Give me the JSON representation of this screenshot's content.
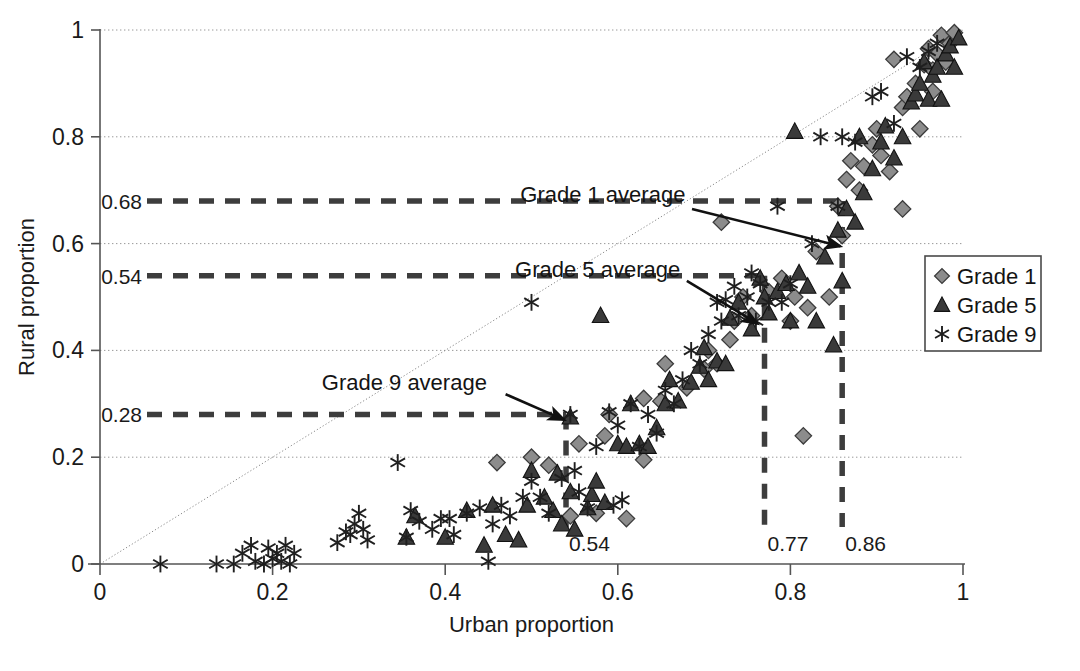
{
  "chart_data": {
    "type": "scatter",
    "title": "",
    "xlabel": "Urban proportion",
    "ylabel": "Rural proportion",
    "xlim": [
      0,
      1
    ],
    "ylim": [
      0,
      1
    ],
    "xticks": [
      "0",
      "0.2",
      "0.4",
      "0.6",
      "0.8",
      "1"
    ],
    "xtick_values": [
      0,
      0.2,
      0.4,
      0.6,
      0.8,
      1
    ],
    "yticks": [
      "0",
      "0.2",
      "0.4",
      "0.6",
      "0.8",
      "1"
    ],
    "ytick_values": [
      0,
      0.2,
      0.4,
      0.6,
      0.8,
      1
    ],
    "grid": true,
    "grid_style": "dotted horizontal gridlines at y = 0.2, 0.4, 0.6, 0.8, 1",
    "legend_position": "right-middle",
    "reference_line": {
      "name": "y = x identity line",
      "style": "dotted",
      "from": [
        0,
        0
      ],
      "to": [
        1,
        1
      ]
    },
    "series": [
      {
        "name": "Grade 1",
        "marker": "diamond",
        "color": "#8c8c8c",
        "edge_color": "#333333",
        "points": [
          [
            0.46,
            0.19
          ],
          [
            0.5,
            0.2
          ],
          [
            0.52,
            0.185
          ],
          [
            0.545,
            0.09
          ],
          [
            0.575,
            0.095
          ],
          [
            0.61,
            0.085
          ],
          [
            0.585,
            0.24
          ],
          [
            0.63,
            0.195
          ],
          [
            0.555,
            0.225
          ],
          [
            0.59,
            0.28
          ],
          [
            0.63,
            0.31
          ],
          [
            0.65,
            0.305
          ],
          [
            0.655,
            0.375
          ],
          [
            0.68,
            0.33
          ],
          [
            0.7,
            0.365
          ],
          [
            0.705,
            0.4
          ],
          [
            0.715,
            0.375
          ],
          [
            0.73,
            0.42
          ],
          [
            0.735,
            0.455
          ],
          [
            0.745,
            0.5
          ],
          [
            0.755,
            0.465
          ],
          [
            0.775,
            0.51
          ],
          [
            0.79,
            0.535
          ],
          [
            0.815,
            0.24
          ],
          [
            0.8,
            0.455
          ],
          [
            0.805,
            0.5
          ],
          [
            0.82,
            0.48
          ],
          [
            0.83,
            0.585
          ],
          [
            0.845,
            0.5
          ],
          [
            0.855,
            0.67
          ],
          [
            0.86,
            0.615
          ],
          [
            0.865,
            0.72
          ],
          [
            0.87,
            0.755
          ],
          [
            0.88,
            0.7
          ],
          [
            0.885,
            0.745
          ],
          [
            0.895,
            0.785
          ],
          [
            0.9,
            0.815
          ],
          [
            0.905,
            0.765
          ],
          [
            0.915,
            0.735
          ],
          [
            0.92,
            0.945
          ],
          [
            0.93,
            0.855
          ],
          [
            0.935,
            0.875
          ],
          [
            0.945,
            0.9
          ],
          [
            0.95,
            0.815
          ],
          [
            0.955,
            0.935
          ],
          [
            0.96,
            0.965
          ],
          [
            0.965,
            0.925
          ],
          [
            0.97,
            0.955
          ],
          [
            0.975,
            0.99
          ],
          [
            0.98,
            0.94
          ],
          [
            0.985,
            0.975
          ],
          [
            0.99,
            0.995
          ],
          [
            0.93,
            0.665
          ],
          [
            0.965,
            0.885
          ],
          [
            0.72,
            0.64
          ]
        ]
      },
      {
        "name": "Grade 5",
        "marker": "triangle",
        "color": "#3a3a3a",
        "edge_color": "#1a1a1a",
        "points": [
          [
            0.355,
            0.05
          ],
          [
            0.365,
            0.09
          ],
          [
            0.4,
            0.05
          ],
          [
            0.425,
            0.1
          ],
          [
            0.445,
            0.035
          ],
          [
            0.455,
            0.11
          ],
          [
            0.47,
            0.055
          ],
          [
            0.485,
            0.045
          ],
          [
            0.495,
            0.11
          ],
          [
            0.5,
            0.175
          ],
          [
            0.515,
            0.125
          ],
          [
            0.525,
            0.1
          ],
          [
            0.53,
            0.17
          ],
          [
            0.535,
            0.075
          ],
          [
            0.545,
            0.135
          ],
          [
            0.55,
            0.065
          ],
          [
            0.565,
            0.105
          ],
          [
            0.57,
            0.13
          ],
          [
            0.575,
            0.155
          ],
          [
            0.585,
            0.115
          ],
          [
            0.6,
            0.225
          ],
          [
            0.61,
            0.22
          ],
          [
            0.625,
            0.225
          ],
          [
            0.635,
            0.22
          ],
          [
            0.645,
            0.255
          ],
          [
            0.655,
            0.3
          ],
          [
            0.66,
            0.345
          ],
          [
            0.67,
            0.305
          ],
          [
            0.685,
            0.34
          ],
          [
            0.695,
            0.37
          ],
          [
            0.7,
            0.405
          ],
          [
            0.705,
            0.345
          ],
          [
            0.715,
            0.38
          ],
          [
            0.725,
            0.375
          ],
          [
            0.73,
            0.46
          ],
          [
            0.74,
            0.49
          ],
          [
            0.755,
            0.44
          ],
          [
            0.765,
            0.535
          ],
          [
            0.77,
            0.5
          ],
          [
            0.775,
            0.47
          ],
          [
            0.785,
            0.51
          ],
          [
            0.795,
            0.525
          ],
          [
            0.8,
            0.455
          ],
          [
            0.805,
            0.81
          ],
          [
            0.81,
            0.545
          ],
          [
            0.82,
            0.52
          ],
          [
            0.83,
            0.455
          ],
          [
            0.84,
            0.575
          ],
          [
            0.85,
            0.41
          ],
          [
            0.855,
            0.625
          ],
          [
            0.86,
            0.53
          ],
          [
            0.865,
            0.665
          ],
          [
            0.875,
            0.64
          ],
          [
            0.88,
            0.8
          ],
          [
            0.885,
            0.695
          ],
          [
            0.895,
            0.74
          ],
          [
            0.905,
            0.79
          ],
          [
            0.91,
            0.82
          ],
          [
            0.92,
            0.76
          ],
          [
            0.93,
            0.8
          ],
          [
            0.94,
            0.865
          ],
          [
            0.945,
            0.88
          ],
          [
            0.95,
            0.9
          ],
          [
            0.955,
            0.94
          ],
          [
            0.96,
            0.87
          ],
          [
            0.965,
            0.915
          ],
          [
            0.97,
            0.93
          ],
          [
            0.975,
            0.87
          ],
          [
            0.98,
            0.955
          ],
          [
            0.985,
            0.97
          ],
          [
            0.99,
            0.93
          ],
          [
            0.995,
            0.985
          ],
          [
            0.58,
            0.465
          ],
          [
            0.545,
            0.275
          ],
          [
            0.615,
            0.3
          ]
        ]
      },
      {
        "name": "Grade 9",
        "marker": "asterisk",
        "color": "#222222",
        "edge_color": "#111111",
        "points": [
          [
            0.07,
            0.0
          ],
          [
            0.135,
            0.0
          ],
          [
            0.155,
            0.0
          ],
          [
            0.165,
            0.02
          ],
          [
            0.175,
            0.035
          ],
          [
            0.18,
            0.005
          ],
          [
            0.19,
            0.0
          ],
          [
            0.195,
            0.03
          ],
          [
            0.2,
            0.01
          ],
          [
            0.205,
            0.02
          ],
          [
            0.21,
            0.005
          ],
          [
            0.215,
            0.035
          ],
          [
            0.22,
            0.0
          ],
          [
            0.225,
            0.02
          ],
          [
            0.275,
            0.04
          ],
          [
            0.285,
            0.06
          ],
          [
            0.29,
            0.055
          ],
          [
            0.295,
            0.075
          ],
          [
            0.3,
            0.095
          ],
          [
            0.305,
            0.065
          ],
          [
            0.31,
            0.045
          ],
          [
            0.345,
            0.19
          ],
          [
            0.355,
            0.05
          ],
          [
            0.36,
            0.1
          ],
          [
            0.37,
            0.08
          ],
          [
            0.385,
            0.065
          ],
          [
            0.395,
            0.085
          ],
          [
            0.405,
            0.085
          ],
          [
            0.41,
            0.055
          ],
          [
            0.425,
            0.095
          ],
          [
            0.44,
            0.105
          ],
          [
            0.45,
            0.005
          ],
          [
            0.455,
            0.075
          ],
          [
            0.465,
            0.11
          ],
          [
            0.475,
            0.09
          ],
          [
            0.49,
            0.125
          ],
          [
            0.5,
            0.155
          ],
          [
            0.51,
            0.125
          ],
          [
            0.52,
            0.095
          ],
          [
            0.535,
            0.16
          ],
          [
            0.545,
            0.28
          ],
          [
            0.55,
            0.175
          ],
          [
            0.555,
            0.135
          ],
          [
            0.5,
            0.49
          ],
          [
            0.575,
            0.22
          ],
          [
            0.59,
            0.285
          ],
          [
            0.6,
            0.26
          ],
          [
            0.615,
            0.3
          ],
          [
            0.625,
            0.22
          ],
          [
            0.635,
            0.28
          ],
          [
            0.645,
            0.245
          ],
          [
            0.655,
            0.325
          ],
          [
            0.665,
            0.3
          ],
          [
            0.675,
            0.345
          ],
          [
            0.685,
            0.4
          ],
          [
            0.695,
            0.375
          ],
          [
            0.705,
            0.43
          ],
          [
            0.715,
            0.49
          ],
          [
            0.72,
            0.455
          ],
          [
            0.725,
            0.495
          ],
          [
            0.735,
            0.52
          ],
          [
            0.74,
            0.465
          ],
          [
            0.75,
            0.5
          ],
          [
            0.755,
            0.545
          ],
          [
            0.76,
            0.455
          ],
          [
            0.765,
            0.525
          ],
          [
            0.775,
            0.49
          ],
          [
            0.785,
            0.67
          ],
          [
            0.79,
            0.49
          ],
          [
            0.8,
            0.525
          ],
          [
            0.825,
            0.6
          ],
          [
            0.835,
            0.8
          ],
          [
            0.855,
            0.67
          ],
          [
            0.86,
            0.8
          ],
          [
            0.875,
            0.79
          ],
          [
            0.895,
            0.875
          ],
          [
            0.905,
            0.885
          ],
          [
            0.92,
            0.825
          ],
          [
            0.935,
            0.95
          ],
          [
            0.95,
            0.93
          ],
          [
            0.96,
            0.96
          ],
          [
            0.97,
            0.975
          ],
          [
            0.605,
            0.12
          ],
          [
            0.595,
            0.11
          ],
          [
            0.565,
            0.105
          ]
        ]
      }
    ],
    "annotations": [
      {
        "id": "grade1-avg",
        "label": "Grade 1 average",
        "text_x": 0.487,
        "text_y": 0.692,
        "arrow_from": [
          0.686,
          0.665
        ],
        "arrow_to": [
          0.858,
          0.595
        ],
        "value_x": 0.86,
        "value_y": 0.68
      },
      {
        "id": "grade5-avg",
        "label": "Grade 5 average",
        "text_x": 0.481,
        "text_y": 0.553,
        "arrow_from": [
          0.68,
          0.53
        ],
        "arrow_to": [
          0.762,
          0.45
        ],
        "value_x": 0.77,
        "value_y": 0.54
      },
      {
        "id": "grade9-avg",
        "label": "Grade 9 average",
        "text_x": 0.257,
        "text_y": 0.34,
        "arrow_from": [
          0.47,
          0.318
        ],
        "arrow_to": [
          0.538,
          0.27
        ],
        "value_x": 0.54,
        "value_y": 0.28
      }
    ],
    "reference_values": {
      "y_dashed": [
        {
          "label": "0.68",
          "value": 0.68,
          "series": "Grade 1"
        },
        {
          "label": "0.54",
          "value": 0.54,
          "series": "Grade 5"
        },
        {
          "label": "0.28",
          "value": 0.28,
          "series": "Grade 9"
        }
      ],
      "x_dashed": [
        {
          "label": "0.54",
          "value": 0.54,
          "series": "Grade 9"
        },
        {
          "label": "0.77",
          "value": 0.77,
          "series": "Grade 5"
        },
        {
          "label": "0.86",
          "value": 0.86,
          "series": "Grade 1"
        }
      ]
    },
    "legend": [
      {
        "label": "Grade 1",
        "marker": "diamond"
      },
      {
        "label": "Grade 5",
        "marker": "triangle"
      },
      {
        "label": "Grade 9",
        "marker": "asterisk"
      }
    ]
  },
  "colors": {
    "axis": "#555555",
    "grid": "#999999",
    "dashed": "#3d3d3d",
    "diamond_fill": "#8c8c8c",
    "triangle_fill": "#3a3a3a",
    "asterisk": "#1f1f1f",
    "text": "#1a1a1a",
    "legend_border": "#4a4a4a"
  },
  "caption": {
    "text": ""
  }
}
